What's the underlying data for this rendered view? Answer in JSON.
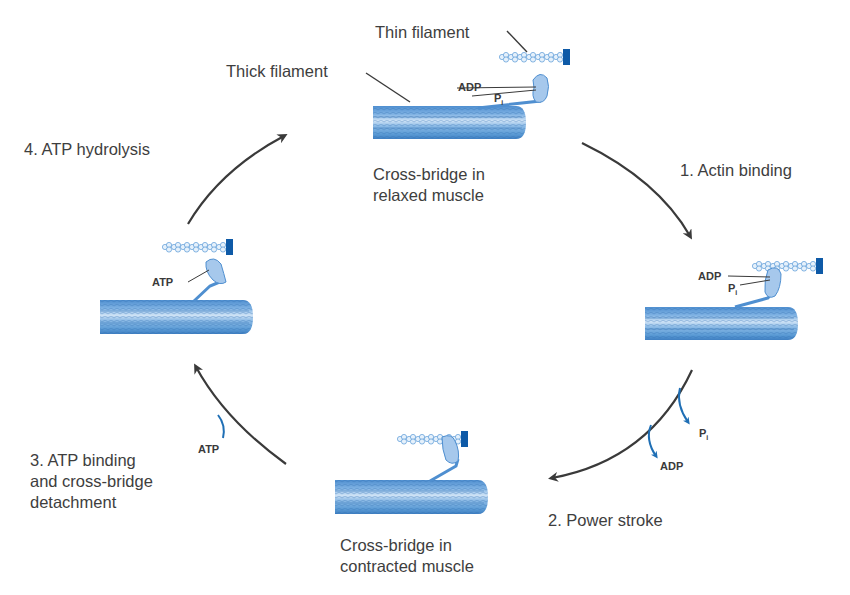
{
  "diagram": {
    "colors": {
      "filament_blue": "#5b9bd5",
      "filament_dark": "#2f6fb0",
      "anchor_blue": "#0e5aa7",
      "arrow_gray": "#3a3a3a",
      "release_arrow_blue": "#1f6fb5",
      "text_gray": "#3e3e3e"
    },
    "stages": [
      {
        "id": "relaxed",
        "caption_line1": "Cross-bridge in",
        "caption_line2": "relaxed muscle",
        "labels": {
          "thin_filament": "Thin filament",
          "thick_filament": "Thick filament",
          "adp": "ADP",
          "pi_base": "P",
          "pi_sub": "i"
        }
      },
      {
        "id": "bound",
        "labels": {
          "adp": "ADP",
          "pi_base": "P",
          "pi_sub": "i"
        }
      },
      {
        "id": "contracted",
        "caption_line1": "Cross-bridge in",
        "caption_line2": "contracted muscle"
      },
      {
        "id": "detached",
        "labels": {
          "atp": "ATP"
        }
      }
    ],
    "steps": [
      {
        "number": "1.",
        "label": "1. Actin binding"
      },
      {
        "number": "2.",
        "label": "2. Power stroke",
        "released": [
          "ADP",
          "P"
        ],
        "released_pi_sub": "i"
      },
      {
        "number": "3.",
        "label_line1": "3. ATP binding",
        "label_line2": "and cross-bridge",
        "label_line3": "detachment",
        "added": "ATP"
      },
      {
        "number": "4.",
        "label": "4. ATP hydrolysis"
      }
    ]
  }
}
